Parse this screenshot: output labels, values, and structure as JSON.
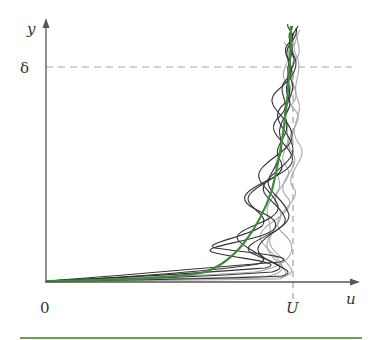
{
  "diagram": {
    "labels": {
      "y_axis": "y",
      "x_axis": "u",
      "delta": "δ",
      "origin": "0",
      "freestream": "U"
    },
    "colors": {
      "axis": "#555555",
      "mean_profile": "#3f8a3a",
      "dashed_guide": "#8fbf7f",
      "instantaneous_dark": "#333333",
      "instantaneous_light": "#aaaaaa",
      "bottom_rule": "#6aa05a"
    },
    "elements": [
      "y-axis with arrow",
      "u-axis with arrow",
      "boundary-layer thickness dashed line (δ)",
      "free-stream velocity dashed line (U)",
      "mean velocity profile (green curve)",
      "instantaneous turbulent profiles (grey wavy curves)"
    ]
  }
}
